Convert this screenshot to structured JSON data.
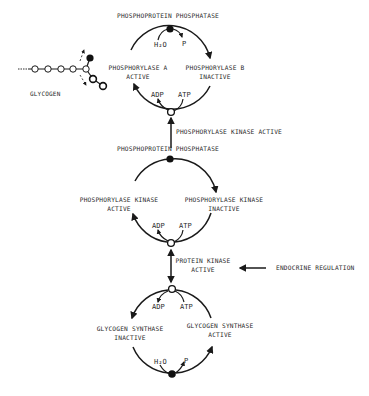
{
  "diagram": {
    "type": "glycogen metabolism regulation cascade",
    "glycogen": {
      "label": "Glycogen"
    },
    "cycle_top": {
      "enzyme_top": "Phosphoprotein phosphatase",
      "left_label_1": "Phosphorylase a",
      "left_label_2": "active",
      "right_label_1": "Phosphorylase b",
      "right_label_2": "inactive",
      "top_in": "H₂O",
      "top_out": "P",
      "bottom_out": "ADP",
      "bottom_in": "ATP"
    },
    "link_top": {
      "label": "Phosphorylase Kinase active"
    },
    "cycle_middle": {
      "enzyme_top": "Phosphoprotein phosphatase",
      "left_label_1": "Phosphorylase Kinase",
      "left_label_2": "active",
      "right_label_1": "Phosphorylase Kinase",
      "right_label_2": "inactive",
      "bottom_out": "ADP",
      "bottom_in": "ATP"
    },
    "link_middle": {
      "label_1": "Protein Kinase",
      "label_2": "active",
      "input_label": "Endocrine regulation"
    },
    "cycle_bottom": {
      "left_label_1": "Glycogen synthase",
      "left_label_2": "inactive",
      "right_label_1": "Glycogen synthase",
      "right_label_2": "active",
      "top_out": "ADP",
      "top_in": "ATP",
      "bottom_in": "H₂O",
      "bottom_out": "P"
    }
  }
}
